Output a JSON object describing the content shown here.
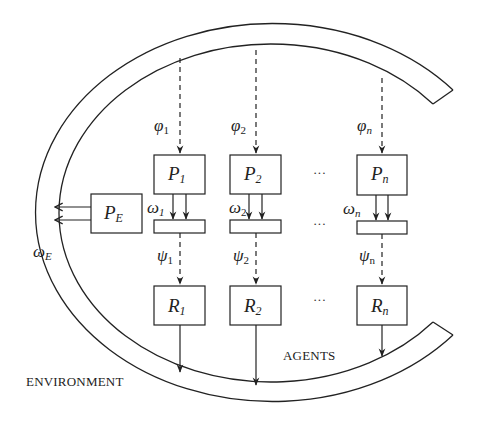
{
  "diagram": {
    "type": "multi-agent environment diagram",
    "environment_label": "ENVIRONMENT",
    "agents_label": "AGENTS",
    "ellipsis": "···",
    "environment_node": {
      "label_main": "P",
      "label_sub": "E",
      "output_symbol": "ω",
      "output_sub": "E"
    },
    "agents": [
      {
        "perception_symbol": "φ",
        "perception_sub": "1",
        "p_main": "P",
        "p_sub": "1",
        "action_symbol": "ω",
        "action_sub": "1",
        "decision_symbol": "ψ",
        "decision_sub": "1",
        "r_main": "R",
        "r_sub": "1"
      },
      {
        "perception_symbol": "φ",
        "perception_sub": "2",
        "p_main": "P",
        "p_sub": "2",
        "action_symbol": "ω",
        "action_sub": "2",
        "decision_symbol": "ψ",
        "decision_sub": "2",
        "r_main": "R",
        "r_sub": "2"
      },
      {
        "perception_symbol": "φ",
        "perception_sub": "n",
        "p_main": "P",
        "p_sub": "n",
        "action_symbol": "ω",
        "action_sub": "n",
        "decision_symbol": "ψ",
        "decision_sub": "n",
        "r_main": "R",
        "r_sub": "n"
      }
    ],
    "colors": {
      "stroke": "#222222",
      "background": "#ffffff"
    }
  }
}
